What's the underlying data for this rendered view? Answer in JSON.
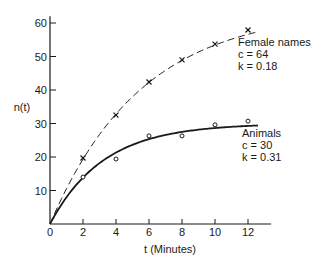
{
  "chart_data": {
    "type": "line",
    "title": "",
    "xlabel": "t (Minutes)",
    "ylabel": "n(t)",
    "xlim": [
      0,
      13.4
    ],
    "ylim": [
      0,
      62
    ],
    "xticks": [
      0,
      2,
      4,
      6,
      8,
      10,
      12
    ],
    "yticks": [
      10,
      20,
      30,
      40,
      50,
      60
    ],
    "grid": false,
    "legend": "none (inline annotations)",
    "x": [
      2,
      4,
      6,
      8,
      10,
      12
    ],
    "series": [
      {
        "name": "Female names",
        "marker": "x",
        "line_style": "dashed",
        "fit": "n(t) = c(1 - e^(-kt))",
        "c": 64,
        "k": 0.18,
        "values": [
          19.7,
          32.5,
          42.4,
          49,
          53.7,
          57.9
        ],
        "annotation": [
          "Female names",
          "c = 64",
          "k = 0.18"
        ]
      },
      {
        "name": "Animals",
        "marker": "o",
        "line_style": "solid",
        "fit": "n(t) = c(1 - e^(-kt))",
        "c": 30,
        "k": 0.31,
        "values": [
          14,
          19.4,
          26.3,
          26.3,
          29.6,
          30.7
        ],
        "annotation": [
          "Animals",
          "c = 30",
          "k = 0.31"
        ]
      }
    ]
  },
  "colors": {
    "ink": "#1a1a1a",
    "background": "#ffffff"
  }
}
